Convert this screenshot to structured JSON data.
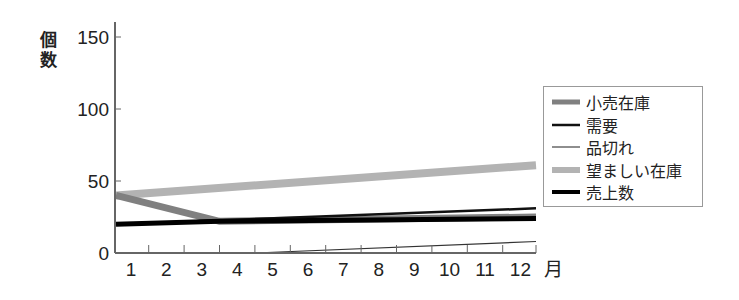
{
  "chart_data": {
    "type": "line",
    "title": "",
    "xlabel": "月",
    "ylabel": "個数",
    "x": [
      1,
      2,
      3,
      4,
      5,
      6,
      7,
      8,
      9,
      10,
      11,
      12
    ],
    "x_tick_labels": [
      "1",
      "2",
      "3",
      "4",
      "5",
      "6",
      "7",
      "8",
      "9",
      "10",
      "11",
      "12"
    ],
    "y_ticks": [
      0,
      50,
      100,
      150
    ],
    "ylim": [
      0,
      160
    ],
    "xlim": [
      0.5,
      12.5
    ],
    "grid": false,
    "legend_position": "right",
    "series": [
      {
        "name": "小売在庫",
        "color": "#808080",
        "width": 7,
        "points": [
          [
            0.5,
            40
          ],
          [
            3.5,
            22
          ],
          [
            12.5,
            25
          ]
        ]
      },
      {
        "name": "需要",
        "color": "#111111",
        "width": 2.5,
        "points": [
          [
            0.5,
            20
          ],
          [
            12.5,
            31
          ]
        ]
      },
      {
        "name": "品切れ",
        "color": "#333333",
        "width": 1.2,
        "points": [
          [
            0.5,
            0
          ],
          [
            4.5,
            0
          ],
          [
            12.5,
            8
          ]
        ]
      },
      {
        "name": "望ましい在庫",
        "color": "#b3b3b3",
        "width": 8,
        "points": [
          [
            0.5,
            40
          ],
          [
            12.5,
            61
          ]
        ]
      },
      {
        "name": "売上数",
        "color": "#000000",
        "width": 5,
        "points": [
          [
            0.5,
            20
          ],
          [
            3.5,
            22
          ],
          [
            12.5,
            24
          ]
        ]
      }
    ]
  },
  "axis": {
    "y_title_line1": "個",
    "y_title_line2": "数",
    "x_title": "月"
  },
  "legend": [
    {
      "label": "小売在庫"
    },
    {
      "label": "需要"
    },
    {
      "label": "品切れ"
    },
    {
      "label": "望ましい在庫"
    },
    {
      "label": "売上数"
    }
  ]
}
